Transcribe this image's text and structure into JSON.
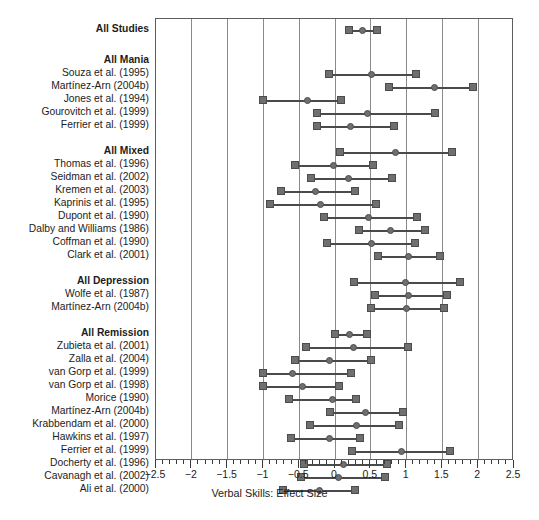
{
  "chart_data": {
    "type": "forest",
    "title": "",
    "xlabel": "Verbal Skills: Effect Size",
    "ylabel": "",
    "xlim": [
      -2.5,
      2.5
    ],
    "xticks": [
      -2.5,
      -2,
      -1.5,
      -1,
      -0.5,
      0,
      0.5,
      1,
      1.5,
      2,
      2.5
    ],
    "xticklabels": [
      "−2.5",
      "−2",
      "−1.5",
      "−1",
      "−0.5",
      "0",
      "0.5",
      "1",
      "1.5",
      "2",
      "2.5"
    ],
    "grid": true,
    "gridlines_x": [
      -2.5,
      -2,
      -1.5,
      -1,
      -0.5,
      0,
      0.5,
      1,
      1.5,
      2,
      2.5
    ],
    "minor_tick_step": 0.1,
    "legend": "",
    "marker_color": "#6f6f6f",
    "line_color": "#4a4a4a",
    "grid_color": "#8a8a8a",
    "rows": [
      {
        "label": "All Studies",
        "group": true,
        "y": 11,
        "lo": 0.2,
        "est": 0.39,
        "hi": 0.58
      },
      {
        "label": "All Mania",
        "group": true,
        "y": 42,
        "lo": null,
        "est": null,
        "hi": null
      },
      {
        "label": "Souza et al. (1995)",
        "group": false,
        "y": 55,
        "lo": -0.08,
        "est": 0.51,
        "hi": 1.13
      },
      {
        "label": "Martínez-Arn (2004b)",
        "group": false,
        "y": 68,
        "lo": 0.76,
        "est": 1.39,
        "hi": 1.93
      },
      {
        "label": "Jones et al. (1994)",
        "group": false,
        "y": 81,
        "lo": -1.0,
        "est": -0.38,
        "hi": 0.08
      },
      {
        "label": "Gourovitch et al. (1999)",
        "group": false,
        "y": 94,
        "lo": -0.25,
        "est": 0.45,
        "hi": 1.4
      },
      {
        "label": "Ferrier et al. (1999)",
        "group": false,
        "y": 107,
        "lo": -0.25,
        "est": 0.22,
        "hi": 0.82
      },
      {
        "label": "All Mixed",
        "group": true,
        "y": 133,
        "lo": 0.07,
        "est": 0.84,
        "hi": 1.64
      },
      {
        "label": "Thomas et al. (1996)",
        "group": false,
        "y": 146,
        "lo": -0.56,
        "est": -0.02,
        "hi": 0.53
      },
      {
        "label": "Seidman et al. (2002)",
        "group": false,
        "y": 159,
        "lo": -0.33,
        "est": 0.19,
        "hi": 0.79
      },
      {
        "label": "Kremen et al. (2003)",
        "group": false,
        "y": 172,
        "lo": -0.76,
        "est": -0.27,
        "hi": 0.28
      },
      {
        "label": "Kaprinis et al. (1995)",
        "group": false,
        "y": 185,
        "lo": -0.91,
        "est": -0.2,
        "hi": 0.57
      },
      {
        "label": "Dupont et al. (1990)",
        "group": false,
        "y": 198,
        "lo": -0.15,
        "est": 0.47,
        "hi": 1.15
      },
      {
        "label": "Dalby and Williams (1986)",
        "group": false,
        "y": 211,
        "lo": 0.33,
        "est": 0.78,
        "hi": 1.26
      },
      {
        "label": "Coffman et al. (1990)",
        "group": false,
        "y": 224,
        "lo": -0.11,
        "est": 0.51,
        "hi": 1.12
      },
      {
        "label": "Clark et al. (2001)",
        "group": false,
        "y": 237,
        "lo": 0.6,
        "est": 1.02,
        "hi": 1.46
      },
      {
        "label": "All Depression",
        "group": true,
        "y": 263,
        "lo": 0.27,
        "est": 0.99,
        "hi": 1.75
      },
      {
        "label": "Wolfe et al. (1987)",
        "group": false,
        "y": 276,
        "lo": 0.56,
        "est": 1.02,
        "hi": 1.57
      },
      {
        "label": "Martínez-Arn (2004b)",
        "group": false,
        "y": 289,
        "lo": 0.5,
        "est": 1.0,
        "hi": 1.52
      },
      {
        "label": "All Remission",
        "group": true,
        "y": 315,
        "lo": 0.0,
        "est": 0.2,
        "hi": 0.45
      },
      {
        "label": "Zubieta et al. (2001)",
        "group": false,
        "y": 328,
        "lo": -0.4,
        "est": 0.26,
        "hi": 1.02
      },
      {
        "label": "Zalla et al. (2004)",
        "group": false,
        "y": 341,
        "lo": -0.56,
        "est": -0.07,
        "hi": 0.5
      },
      {
        "label": "van Gorp et al. (1999)",
        "group": false,
        "y": 354,
        "lo": -1.0,
        "est": -0.59,
        "hi": 0.22
      },
      {
        "label": "van Gorp et al. (1998)",
        "group": false,
        "y": 367,
        "lo": -1.0,
        "est": -0.45,
        "hi": 0.05
      },
      {
        "label": "Morice (1990)",
        "group": false,
        "y": 380,
        "lo": -0.64,
        "est": -0.04,
        "hi": 0.3
      },
      {
        "label": "Martínez-Arn (2004b)",
        "group": false,
        "y": 393,
        "lo": -0.07,
        "est": 0.43,
        "hi": 0.95
      },
      {
        "label": "Krabbendam et al. (2000)",
        "group": false,
        "y": 406,
        "lo": -0.35,
        "est": 0.3,
        "hi": 0.9
      },
      {
        "label": "Hawkins et al. (1997)",
        "group": false,
        "y": 419,
        "lo": -0.62,
        "est": -0.08,
        "hi": 0.35
      },
      {
        "label": "Ferrier et al. (1999)",
        "group": false,
        "y": 432,
        "lo": 0.24,
        "est": 0.93,
        "hi": 1.61
      },
      {
        "label": "Docherty et al. (1996)",
        "group": false,
        "y": 445,
        "lo": -0.43,
        "est": 0.12,
        "hi": 0.72
      },
      {
        "label": "Cavanagh et al. (2002)",
        "group": false,
        "y": 458,
        "lo": -0.48,
        "est": 0.05,
        "hi": 0.7
      },
      {
        "label": "Ali et al. (2000)",
        "group": false,
        "y": 471,
        "lo": -0.72,
        "est": -0.22,
        "hi": 0.28
      }
    ]
  }
}
